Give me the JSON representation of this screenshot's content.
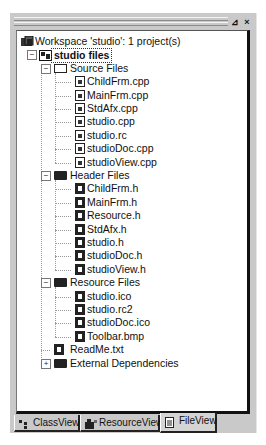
{
  "window": {
    "pin_button": "⊿",
    "close_button": "×"
  },
  "tree": {
    "workspace": "Workspace 'studio': 1 project(s)",
    "project": "studio files",
    "source_folder": "Source Files",
    "source_files": [
      "ChildFrm.cpp",
      "MainFrm.cpp",
      "StdAfx.cpp",
      "studio.cpp",
      "studio.rc",
      "studioDoc.cpp",
      "studioView.cpp"
    ],
    "header_folder": "Header Files",
    "header_files": [
      "ChildFrm.h",
      "MainFrm.h",
      "Resource.h",
      "StdAfx.h",
      "studio.h",
      "studioDoc.h",
      "studioView.h"
    ],
    "resource_folder": "Resource Files",
    "resource_files": [
      "studio.ico",
      "studio.rc2",
      "studioDoc.ico",
      "Toolbar.bmp"
    ],
    "readme": "ReadMe.txt",
    "external": "External Dependencies",
    "expanded_glyph": "−",
    "collapsed_glyph": "+"
  },
  "tabs": [
    {
      "label": "ClassView",
      "icon": "class-icon",
      "active": false
    },
    {
      "label": "ResourceView",
      "icon": "resource-icon",
      "active": false
    },
    {
      "label": "FileView",
      "icon": "file-icon",
      "active": true
    }
  ]
}
